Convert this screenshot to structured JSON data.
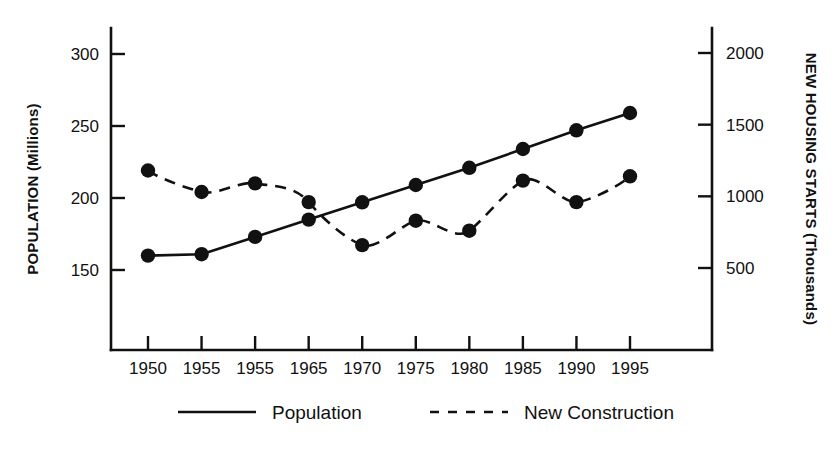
{
  "chart_data": {
    "type": "line",
    "title": "",
    "subtitle": "",
    "xlabel": "",
    "ylabel": "POPULATION (Millions)",
    "y2label": "NEW HOUSING STARTS (Thousands)",
    "grid": false,
    "legend_position": "bottom",
    "categories": [
      "1950",
      "1955",
      "1955",
      "1965",
      "1970",
      "1975",
      "1980",
      "1985",
      "1990",
      "1995"
    ],
    "x_tick_labels": [
      "1950",
      "1955",
      "1955",
      "1965",
      "1970",
      "1975",
      "1980",
      "1985",
      "1990",
      "1995"
    ],
    "y_tick_labels": [
      "150",
      "200",
      "250",
      "300"
    ],
    "y_ticks": [
      150,
      200,
      250,
      300
    ],
    "ylim": [
      115,
      330
    ],
    "y2_tick_labels": [
      "500",
      "1000",
      "1500",
      "2000"
    ],
    "y2_ticks": [
      500,
      1000,
      1500,
      2000
    ],
    "y2lim": [
      0,
      2320
    ],
    "series": [
      {
        "name": "Population",
        "axis": "left",
        "style": "solid",
        "marker": "filled-circle",
        "values": [
          160,
          161,
          173,
          185,
          197,
          209,
          221,
          234,
          247,
          259
        ]
      },
      {
        "name": "New Construction",
        "axis": "right",
        "style": "dashed",
        "marker": "filled-circle",
        "values": [
          1180,
          1030,
          1090,
          960,
          660,
          830,
          760,
          1110,
          960,
          1140
        ]
      }
    ],
    "legend": [
      {
        "label": "Population",
        "style": "solid"
      },
      {
        "label": "New Construction",
        "style": "dashed"
      }
    ]
  }
}
